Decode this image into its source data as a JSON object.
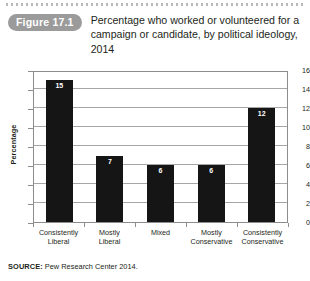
{
  "figure": {
    "badge": "Figure 17.1",
    "title": "Percentage who worked or volunteered for a campaign or candidate, by political ideology, 2014"
  },
  "source": {
    "label": "SOURCE:",
    "text": " Pew Research Center 2014."
  },
  "chart_data": {
    "type": "bar",
    "title": "Percentage who worked or volunteered for a campaign or candidate, by political ideology, 2014",
    "categories": [
      "Consistently Liberal",
      "Mostly Liberal",
      "Mixed",
      "Mostly Conservative",
      "Consistently Conservative"
    ],
    "category_lines": [
      [
        "Consistently",
        "Liberal"
      ],
      [
        "Mostly",
        "Liberal"
      ],
      [
        "Mixed",
        ""
      ],
      [
        "Mostly",
        "Conservative"
      ],
      [
        "Consistently",
        "Conservative"
      ]
    ],
    "values": [
      15,
      7,
      6,
      6,
      12
    ],
    "xlabel": "",
    "ylabel": "Percentage",
    "ylim": [
      0,
      16
    ],
    "yticks": [
      0,
      2,
      4,
      6,
      8,
      10,
      12,
      14,
      16
    ],
    "grid": true,
    "legend": false,
    "bar_color": "#151515",
    "value_label_color": "#ffffff",
    "frame_color": "#8d8d8d",
    "gridline_color": "#a6a6a6"
  }
}
